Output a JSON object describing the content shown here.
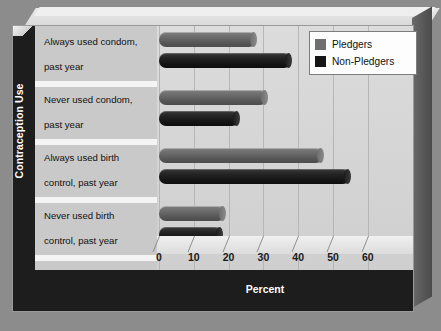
{
  "chart_data": {
    "type": "bar",
    "orientation": "horizontal",
    "title": "",
    "xlabel": "Percent",
    "ylabel": "Contraception Use",
    "xlim": [
      0,
      70
    ],
    "xticks": [
      0,
      10,
      20,
      30,
      40,
      50,
      60
    ],
    "grid": true,
    "legend_position": "top-right",
    "categories": [
      "Always used condom, past year",
      "Never used condom, past year",
      "Always used birth control, past year",
      "Never used birth control, past year"
    ],
    "series": [
      {
        "name": "Pledgers",
        "color": "#6f6f6f",
        "values": [
          28,
          31,
          47,
          19
        ]
      },
      {
        "name": "Non-Pledgers",
        "color": "#151515",
        "values": [
          38,
          23,
          55,
          18
        ]
      }
    ]
  },
  "axis": {
    "y_title": "Contraception Use",
    "x_title": "Percent",
    "x_tick_labels": [
      "0",
      "10",
      "20",
      "30",
      "40",
      "50",
      "60"
    ]
  },
  "categories": [
    {
      "line1": "Always used condom,",
      "line2": "past year"
    },
    {
      "line1": "Never used condom,",
      "line2": "past year"
    },
    {
      "line1": "Always used birth",
      "line2": "control, past year"
    },
    {
      "line1": "Never used birth",
      "line2": "control, past year"
    }
  ],
  "legend": {
    "items": [
      {
        "label": "Pledgers",
        "color": "#6f6f6f"
      },
      {
        "label": "Non-Pledgers",
        "color": "#151515"
      }
    ]
  },
  "colors": {
    "background": "#8c8c8c",
    "panel": "#c9c9c9",
    "plot": "#d3d3d3",
    "frame_dark": "#1d1d1d",
    "pledgers": "#6f6f6f",
    "non_pledgers": "#151515"
  }
}
